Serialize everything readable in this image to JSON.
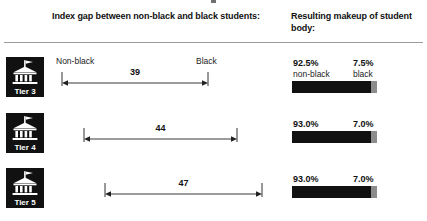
{
  "headers": {
    "gap": "Index gap between non-black and black students:",
    "makeup": "Resulting makeup of student body:"
  },
  "endpoints": {
    "left": "Non-black",
    "right": "Black"
  },
  "rows": [
    {
      "tier_label": "Tier 3",
      "tier_icon": "university-building-icon",
      "gap_value": "39",
      "major_pct": "92.5%",
      "major_label": "non-black",
      "minor_pct": "7.5%",
      "minor_label": "black",
      "major_fraction": 92.5,
      "minor_fraction": 7.5,
      "arrow_start_px": 62,
      "arrow_end_px": 208
    },
    {
      "tier_label": "Tier 4",
      "tier_icon": "university-building-icon",
      "gap_value": "44",
      "major_pct": "93.0%",
      "major_label": "",
      "minor_pct": "7.0%",
      "minor_label": "",
      "major_fraction": 93.0,
      "minor_fraction": 7.0,
      "arrow_start_px": 84,
      "arrow_end_px": 237
    },
    {
      "tier_label": "Tier 5",
      "tier_icon": "university-building-icon",
      "gap_value": "47",
      "major_pct": "93.0%",
      "major_label": "",
      "minor_pct": "7.0%",
      "minor_label": "",
      "major_fraction": 93.0,
      "minor_fraction": 7.0,
      "arrow_start_px": 105,
      "arrow_end_px": 262
    }
  ],
  "colors": {
    "bar_major": "#111111",
    "bar_minor": "#8c8c8c",
    "badge_bg": "#111111",
    "rule": "#9a9a9a",
    "text": "#111111"
  },
  "chart_data": {
    "type": "bar",
    "categories": [
      "Tier 3",
      "Tier 4",
      "Tier 5"
    ],
    "series": [
      {
        "name": "Index gap",
        "values": [
          39,
          44,
          47
        ]
      },
      {
        "name": "Non-black share (%)",
        "values": [
          92.5,
          93.0,
          93.0
        ]
      },
      {
        "name": "Black share (%)",
        "values": [
          7.5,
          7.0,
          7.0
        ]
      }
    ],
    "xlabel": "",
    "ylabel": "",
    "grid": false,
    "legend": "none",
    "annotations": [
      "Non-black",
      "Black"
    ]
  }
}
